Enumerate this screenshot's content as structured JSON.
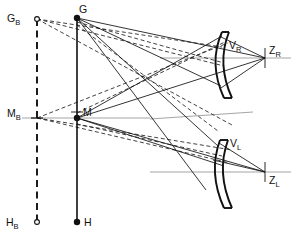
{
  "figure": {
    "kind": "optical-ray-diagram",
    "width": 293,
    "height": 240,
    "background": "#ffffff",
    "stroke_color": "#111111",
    "axis_color": "#9a9a9a"
  },
  "labels": {
    "g_b": {
      "base": "G",
      "sub": "B",
      "x": 8,
      "y": 19
    },
    "g": {
      "base": "G",
      "sub": "",
      "x": 80,
      "y": 13
    },
    "m_b": {
      "base": "M",
      "sub": "B",
      "x": 9,
      "y": 116
    },
    "m": {
      "base": "M",
      "sub": "",
      "x": 82,
      "y": 115
    },
    "h_b": {
      "base": "H",
      "sub": "B",
      "x": 9,
      "y": 226
    },
    "h": {
      "base": "H",
      "sub": "",
      "x": 84,
      "y": 226
    },
    "v_r": {
      "base": "V",
      "sub": "R",
      "x": 229,
      "y": 47
    },
    "z_r": {
      "base": "Z",
      "sub": "R",
      "x": 269,
      "y": 53
    },
    "v_l": {
      "base": "V",
      "sub": "L",
      "x": 229,
      "y": 145
    },
    "z_l": {
      "base": "Z",
      "sub": "L",
      "x": 269,
      "y": 183
    }
  },
  "points": {
    "G_B": {
      "x": 37,
      "y": 19,
      "marker": "open-circle"
    },
    "G": {
      "x": 77,
      "y": 18,
      "marker": "filled-circle"
    },
    "M_B": {
      "x": 37,
      "y": 118,
      "marker": "cross-tick"
    },
    "M": {
      "x": 77,
      "y": 118,
      "marker": "filled-circle"
    },
    "H_B": {
      "x": 37,
      "y": 222,
      "marker": "open-circle"
    },
    "H": {
      "x": 77,
      "y": 222,
      "marker": "filled-circle"
    },
    "V_R": {
      "x": 219,
      "y": 58,
      "marker": "vertex"
    },
    "Z_R": {
      "x": 265,
      "y": 58,
      "marker": "tick"
    },
    "V_L": {
      "x": 219,
      "y": 157,
      "marker": "vertex"
    },
    "Z_L": {
      "x": 265,
      "y": 172,
      "marker": "tick"
    }
  },
  "axes": [
    {
      "name": "right-optical-axis",
      "x1": 160,
      "y1": 58,
      "x2": 291,
      "y2": 58
    },
    {
      "name": "left-optical-axis",
      "x1": 150,
      "y1": 172,
      "x2": 291,
      "y2": 172
    },
    {
      "name": "left-upper-axis",
      "x1": 150,
      "y1": 118,
      "x2": 252,
      "y2": 112
    }
  ],
  "vertical_lines": {
    "solid_axis": {
      "x": 77,
      "y1": 18,
      "y2": 222,
      "style": "solid"
    },
    "dashed_axis": {
      "x1": 37,
      "y1": 19,
      "x2": 37,
      "y2": 222,
      "style": "dashed"
    }
  },
  "elements": {
    "right_mirror": {
      "name": "curved-mirror-right",
      "vertex_x": 219,
      "top_y": 32,
      "bottom_y": 98
    },
    "left_mirror": {
      "name": "curved-mirror-left",
      "vertex_x": 219,
      "top_y": 140,
      "bottom_y": 208
    }
  },
  "rays": {
    "solid": [
      {
        "from": "G",
        "to": "Z_R",
        "x1": 77,
        "y1": 18,
        "x2": 265,
        "y2": 58
      },
      {
        "from": "G",
        "to": "mirror-right-lower",
        "x1": 77,
        "y1": 18,
        "x2": 219,
        "y2": 88
      },
      {
        "from": "G",
        "to": "V_L-region",
        "x1": 77,
        "y1": 18,
        "x2": 216,
        "y2": 148
      },
      {
        "from": "G",
        "to": "left-lower",
        "x1": 77,
        "y1": 18,
        "x2": 200,
        "y2": 196
      },
      {
        "from": "M",
        "to": "mirror-right-top",
        "x1": 77,
        "y1": 118,
        "x2": 219,
        "y2": 36
      },
      {
        "from": "M",
        "to": "Z_R",
        "x1": 77,
        "y1": 118,
        "x2": 265,
        "y2": 58
      },
      {
        "from": "M",
        "to": "Z_L",
        "x1": 77,
        "y1": 118,
        "x2": 265,
        "y2": 172
      },
      {
        "from": "M",
        "to": "mirror-left-lower",
        "x1": 77,
        "y1": 118,
        "x2": 219,
        "y2": 163
      },
      {
        "from": "V_R",
        "to": "Z_R-fan-upper",
        "x1": 219,
        "y1": 58,
        "x2": 265,
        "y2": 58
      },
      {
        "from": "mirror-right-bottom",
        "to": "Z_R",
        "x1": 219,
        "y1": 88,
        "x2": 265,
        "y2": 58
      },
      {
        "from": "mirror-right-top",
        "to": "Z_R",
        "x1": 219,
        "y1": 36,
        "x2": 265,
        "y2": 58
      },
      {
        "from": "mirror-left-top",
        "to": "Z_L",
        "x1": 219,
        "y1": 145,
        "x2": 265,
        "y2": 172
      },
      {
        "from": "mirror-left-mid",
        "to": "Z_L",
        "x1": 216,
        "y1": 160,
        "x2": 265,
        "y2": 172
      }
    ],
    "dashed": [
      {
        "from": "G_B",
        "to": "mirror-right-upper",
        "x1": 37,
        "y1": 19,
        "x2": 219,
        "y2": 48
      },
      {
        "from": "G_B",
        "to": "mirror-right-lower",
        "x1": 37,
        "y1": 19,
        "x2": 219,
        "y2": 68
      },
      {
        "from": "G_B",
        "to": "M-lower-fan",
        "x1": 37,
        "y1": 19,
        "x2": 219,
        "y2": 128
      },
      {
        "from": "M_B",
        "to": "mirror-right-upper",
        "x1": 37,
        "y1": 118,
        "x2": 219,
        "y2": 52
      },
      {
        "from": "M_B",
        "to": "mirror-left-region",
        "x1": 37,
        "y1": 118,
        "x2": 219,
        "y2": 152
      },
      {
        "from": "M_B",
        "to": "mirror-left-low",
        "x1": 37,
        "y1": 118,
        "x2": 219,
        "y2": 166
      },
      {
        "from": "G",
        "to": "right-fan-dashed",
        "x1": 77,
        "y1": 24,
        "x2": 219,
        "y2": 62
      },
      {
        "from": "M",
        "to": "mirror-right-dashed",
        "x1": 77,
        "y1": 112,
        "x2": 219,
        "y2": 44
      }
    ]
  }
}
